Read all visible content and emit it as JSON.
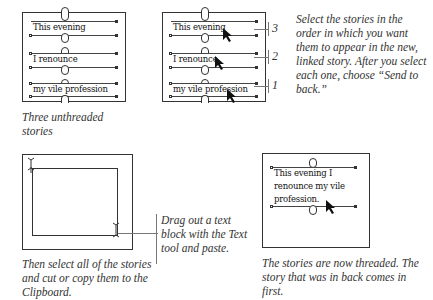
{
  "panels": {
    "unthreaded": {
      "stories": [
        "This evening",
        "I renounce",
        "my vile profession"
      ],
      "caption": "Three unthreaded stories"
    },
    "select_order": {
      "stories": [
        "This evening",
        "I renounce",
        "my vile profession"
      ],
      "order_numbers": [
        "3",
        "2",
        "1"
      ],
      "caption": "Select the stories in the order in which you want them to appear in the new, linked story. After you select each one, choose “Send to back.”"
    },
    "paste_block": {
      "caption": "Then select all of the stories and cut or copy them to the Clipboard.",
      "callout": "Drag out a text block with the Text tool and paste."
    },
    "threaded": {
      "story_lines": [
        "This evening I",
        "renounce my vile",
        "profession."
      ],
      "caption": "The stories are now threaded. The story that was in back comes in first."
    }
  },
  "icons": {
    "pointer": "arrow-cursor-icon",
    "ibeam": "text-ibeam-cursor-icon"
  }
}
